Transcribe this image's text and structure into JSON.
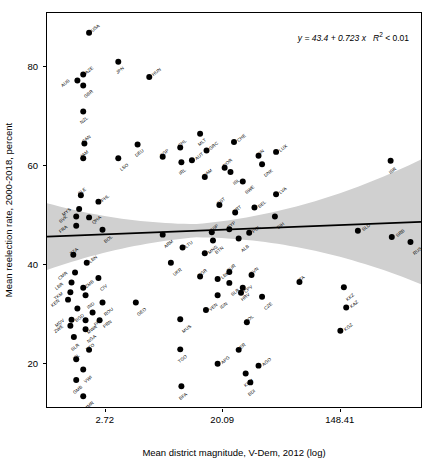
{
  "chart_data": {
    "type": "scatter",
    "title": "",
    "xlabel": "Mean district magnitude, V-Dem, 2012 (log)",
    "ylabel": "Mean reelection rate, 2000-2018, percent",
    "xticks": [
      "2.72",
      "20.09",
      "148.41"
    ],
    "xtick_values": [
      2.72,
      20.09,
      148.41
    ],
    "yticks": [
      "20",
      "40",
      "60",
      "80"
    ],
    "ytick_values": [
      20,
      40,
      60,
      80
    ],
    "xlim_log": [
      0.0,
      6.4
    ],
    "ylim": [
      11,
      91
    ],
    "grid": false,
    "legend": null,
    "annotation": {
      "equation": "y = 43.4 + 0.723 x",
      "r2": "R",
      "r2_sup": "2",
      "r2_rest": " < 0.01"
    },
    "fit": {
      "intercept": 43.4,
      "slope": 0.723,
      "r_squared_text": "< 0.01",
      "band": "95% confidence interval",
      "band_color": "#d0d0d0",
      "line_color": "#000000"
    },
    "point_color": "#000000",
    "points": [
      {
        "label": "USA",
        "x": 0.72,
        "y": 87.0,
        "lp": "tr"
      },
      {
        "label": "JPN",
        "x": 1.22,
        "y": 81.1,
        "lp": "bl"
      },
      {
        "label": "AZE",
        "x": 0.62,
        "y": 78.5,
        "lp": "tr"
      },
      {
        "label": "HUN",
        "x": 1.75,
        "y": 78.0,
        "lp": "tr"
      },
      {
        "label": "AUS",
        "x": 0.52,
        "y": 77.3,
        "lp": "l"
      },
      {
        "label": "GBR",
        "x": 0.62,
        "y": 76.3,
        "lp": "br"
      },
      {
        "label": "NZL",
        "x": 0.62,
        "y": 71.0,
        "lp": "bl"
      },
      {
        "label": "MLT",
        "x": 2.62,
        "y": 66.5,
        "lp": "bl"
      },
      {
        "label": "CHE",
        "x": 3.2,
        "y": 64.8,
        "lp": "tr"
      },
      {
        "label": "CAN",
        "x": 0.64,
        "y": 64.5,
        "lp": "tl"
      },
      {
        "label": "DEU",
        "x": 1.55,
        "y": 64.3,
        "lp": "bl"
      },
      {
        "label": "CHL",
        "x": 2.28,
        "y": 63.7,
        "lp": "tl"
      },
      {
        "label": "GRC",
        "x": 2.73,
        "y": 63.1,
        "lp": "tr"
      },
      {
        "label": "LUX",
        "x": 3.92,
        "y": 62.8,
        "lp": "tr"
      },
      {
        "label": "FIN",
        "x": 3.62,
        "y": 62.0,
        "lp": "tl"
      },
      {
        "label": "SGP",
        "x": 1.98,
        "y": 61.8,
        "lp": "tl"
      },
      {
        "label": "ISR",
        "x": 5.88,
        "y": 61.0,
        "lp": "bl"
      },
      {
        "label": "AUT",
        "x": 2.48,
        "y": 61.1,
        "lp": "tr"
      },
      {
        "label": "JAM",
        "x": 0.62,
        "y": 61.5,
        "lp": "tl"
      },
      {
        "label": "LSO",
        "x": 1.22,
        "y": 61.5,
        "lp": "br"
      },
      {
        "label": "IRL",
        "x": 2.3,
        "y": 60.7,
        "lp": "bl"
      },
      {
        "label": "DNK",
        "x": 3.68,
        "y": 60.3,
        "lp": "br"
      },
      {
        "label": "NOR",
        "x": 3.04,
        "y": 59.6,
        "lp": "tl"
      },
      {
        "label": "ISL",
        "x": 3.14,
        "y": 58.7,
        "lp": "br"
      },
      {
        "label": "NAM",
        "x": 2.7,
        "y": 57.7,
        "lp": "tl"
      },
      {
        "label": "SWE",
        "x": 3.35,
        "y": 56.8,
        "lp": "br"
      },
      {
        "label": "SLE",
        "x": 0.58,
        "y": 54.0,
        "lp": "tl"
      },
      {
        "label": "LVA",
        "x": 3.92,
        "y": 54.2,
        "lp": "tr"
      },
      {
        "label": "PHL",
        "x": 0.88,
        "y": 52.7,
        "lp": "tr"
      },
      {
        "label": "EST",
        "x": 2.95,
        "y": 52.0,
        "lp": "tl"
      },
      {
        "label": "MYS",
        "x": 0.55,
        "y": 51.2,
        "lp": "l"
      },
      {
        "label": "BEL",
        "x": 3.55,
        "y": 51.5,
        "lp": "tr"
      },
      {
        "label": "PRT",
        "x": 3.22,
        "y": 50.5,
        "lp": "tl"
      },
      {
        "label": "SVK",
        "x": 0.5,
        "y": 49.7,
        "lp": "l"
      },
      {
        "label": "QHA",
        "x": 0.72,
        "y": 49.5,
        "lp": "r"
      },
      {
        "label": "BIH",
        "x": 3.9,
        "y": 49.7,
        "lp": "br"
      },
      {
        "label": "FRA",
        "x": 0.5,
        "y": 47.8,
        "lp": "l"
      },
      {
        "label": "BOL",
        "x": 0.95,
        "y": 47.0,
        "lp": "br"
      },
      {
        "label": "ESP",
        "x": 2.82,
        "y": 46.5,
        "lp": "tl"
      },
      {
        "label": "CYP",
        "x": 3.12,
        "y": 47.1,
        "lp": "tl"
      },
      {
        "label": "POL",
        "x": 3.46,
        "y": 46.4,
        "lp": "tr"
      },
      {
        "label": "SLD",
        "x": 5.32,
        "y": 46.8,
        "lp": "tr"
      },
      {
        "label": "ARM",
        "x": 1.98,
        "y": 46.0,
        "lp": "br"
      },
      {
        "label": "ALB",
        "x": 3.28,
        "y": 45.2,
        "lp": "br"
      },
      {
        "label": "SRB",
        "x": 5.9,
        "y": 45.5,
        "lp": "tr"
      },
      {
        "label": "BTN",
        "x": 2.84,
        "y": 44.8,
        "lp": "br"
      },
      {
        "label": "RUS",
        "x": 6.22,
        "y": 44.5,
        "lp": "br"
      },
      {
        "label": "LTU",
        "x": 2.32,
        "y": 43.4,
        "lp": "tr"
      },
      {
        "label": "TZA",
        "x": 0.45,
        "y": 41.9,
        "lp": "tl"
      },
      {
        "label": "MNG",
        "x": 2.7,
        "y": 42.2,
        "lp": "tr"
      },
      {
        "label": "LBN",
        "x": 0.68,
        "y": 40.3,
        "lp": "tr"
      },
      {
        "label": "UKR",
        "x": 2.12,
        "y": 40.3,
        "lp": "br"
      },
      {
        "label": "CMR",
        "x": 0.48,
        "y": 38.3,
        "lp": "l"
      },
      {
        "label": "TUR",
        "x": 3.12,
        "y": 38.4,
        "lp": "tl"
      },
      {
        "label": "BGR",
        "x": 2.62,
        "y": 37.5,
        "lp": "tl"
      },
      {
        "label": "SVN",
        "x": 3.5,
        "y": 37.8,
        "lp": "tl"
      },
      {
        "label": "CIV",
        "x": 0.88,
        "y": 37.2,
        "lp": "br"
      },
      {
        "label": "LBN2",
        "x": 2.92,
        "y": 37.0,
        "lp": "tr"
      },
      {
        "label": "LBR",
        "x": 0.42,
        "y": 36.3,
        "lp": "l"
      },
      {
        "label": "SLR",
        "x": 3.12,
        "y": 36.2,
        "lp": "br"
      },
      {
        "label": "ITA",
        "x": 4.32,
        "y": 36.4,
        "lp": "tl"
      },
      {
        "label": "ZMB",
        "x": 0.62,
        "y": 35.2,
        "lp": "tr"
      },
      {
        "label": "HRV",
        "x": 3.35,
        "y": 35.2,
        "lp": "bl"
      },
      {
        "label": "KKZ",
        "x": 5.08,
        "y": 35.3,
        "lp": "br"
      },
      {
        "label": "TKM",
        "x": 0.4,
        "y": 34.3,
        "lp": "l"
      },
      {
        "label": "CPV",
        "x": 3.32,
        "y": 34.2,
        "lp": "tr"
      },
      {
        "label": "IND",
        "x": 0.66,
        "y": 33.7,
        "lp": "br"
      },
      {
        "label": "IDN",
        "x": 2.92,
        "y": 33.7,
        "lp": "br"
      },
      {
        "label": "CZE",
        "x": 3.68,
        "y": 33.4,
        "lp": "br"
      },
      {
        "label": "KEN",
        "x": 0.36,
        "y": 32.8,
        "lp": "l"
      },
      {
        "label": "ROU",
        "x": 0.95,
        "y": 32.2,
        "lp": "br"
      },
      {
        "label": "GEO",
        "x": 1.52,
        "y": 32.2,
        "lp": "br"
      },
      {
        "label": "BGD",
        "x": 0.52,
        "y": 31.0,
        "lp": "bl"
      },
      {
        "label": "KAZ",
        "x": 5.12,
        "y": 31.2,
        "lp": "tr"
      },
      {
        "label": "VEN",
        "x": 2.72,
        "y": 30.7,
        "lp": "tr"
      },
      {
        "label": "PAK",
        "x": 0.78,
        "y": 30.2,
        "lp": "br"
      },
      {
        "label": "MUS",
        "x": 2.28,
        "y": 28.8,
        "lp": "br"
      },
      {
        "label": "MDV",
        "x": 0.42,
        "y": 28.7,
        "lp": "l"
      },
      {
        "label": "MWA",
        "x": 0.66,
        "y": 28.6,
        "lp": "br"
      },
      {
        "label": "PRN",
        "x": 0.9,
        "y": 28.6,
        "lp": "r"
      },
      {
        "label": "COL",
        "x": 3.42,
        "y": 28.2,
        "lp": "tl"
      },
      {
        "label": "ZWE",
        "x": 0.4,
        "y": 27.5,
        "lp": "l"
      },
      {
        "label": "NGA",
        "x": 0.66,
        "y": 26.8,
        "lp": "br"
      },
      {
        "label": "KGZ",
        "x": 5.02,
        "y": 26.5,
        "lp": "tr"
      },
      {
        "label": "SLR2",
        "x": 0.46,
        "y": 25.2,
        "lp": "bl"
      },
      {
        "label": "TTO",
        "x": 0.72,
        "y": 22.6,
        "lp": "tl"
      },
      {
        "label": "TGO",
        "x": 2.28,
        "y": 22.7,
        "lp": "bl"
      },
      {
        "label": "PER",
        "x": 3.28,
        "y": 22.6,
        "lp": "tl"
      },
      {
        "label": "ISL2",
        "x": 0.5,
        "y": 20.7,
        "lp": "tl"
      },
      {
        "label": "APG",
        "x": 2.92,
        "y": 19.8,
        "lp": "tr"
      },
      {
        "label": "AGO",
        "x": 3.62,
        "y": 19.4,
        "lp": "tr"
      },
      {
        "label": "VWI",
        "x": 0.62,
        "y": 18.6,
        "lp": "br"
      },
      {
        "label": "KHM",
        "x": 3.4,
        "y": 17.8,
        "lp": "bl"
      },
      {
        "label": "GMB",
        "x": 0.5,
        "y": 16.5,
        "lp": "bl"
      },
      {
        "label": "BDI",
        "x": 3.48,
        "y": 16.0,
        "lp": "bl"
      },
      {
        "label": "BFA",
        "x": 2.3,
        "y": 15.2,
        "lp": "bl"
      },
      {
        "label": "MMR",
        "x": 0.62,
        "y": 13.2,
        "lp": "br"
      }
    ]
  }
}
